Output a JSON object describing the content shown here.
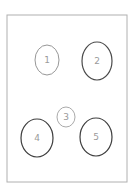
{
  "diagram": {
    "frame": {
      "x": 7,
      "y": 15,
      "width": 120,
      "height": 167,
      "stroke": "#b0b0b0"
    },
    "nodes": [
      {
        "label": "1",
        "cx": 47,
        "cy": 60,
        "rx": 12,
        "ry": 15,
        "stroke": "#8a8a8a",
        "width": 0.9
      },
      {
        "label": "2",
        "cx": 97,
        "cy": 61,
        "rx": 15,
        "ry": 19,
        "stroke": "#4a4a4a",
        "width": 1.2
      },
      {
        "label": "3",
        "cx": 66,
        "cy": 117,
        "rx": 9,
        "ry": 10,
        "stroke": "#a0a0a0",
        "width": 0.9
      },
      {
        "label": "4",
        "cx": 37,
        "cy": 138,
        "rx": 16,
        "ry": 19,
        "stroke": "#3e3e3e",
        "width": 1.2
      },
      {
        "label": "5",
        "cx": 96,
        "cy": 137,
        "rx": 16,
        "ry": 19,
        "stroke": "#3e3e3e",
        "width": 1.2
      }
    ]
  }
}
